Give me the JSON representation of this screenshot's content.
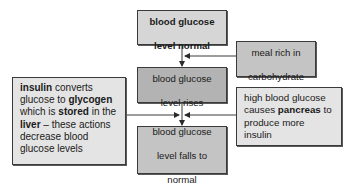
{
  "diagram": {
    "colors": {
      "box_light": "#d6d6d6",
      "box_medium": "#b3b3b3",
      "box_pale": "#e4e4e4",
      "border": "#3a3a3a",
      "line": "#3a3a3a"
    },
    "nodes": {
      "normal": {
        "line1": "blood glucose",
        "line2": "level normal",
        "bold": true
      },
      "meal": {
        "line1": "meal rich in",
        "line2": "carbohydrate"
      },
      "rises": {
        "line1": "blood glucose",
        "line2": "level rises"
      },
      "falls": {
        "line1": "blood glucose",
        "line2": "level falls to",
        "line3": "normal"
      },
      "insulin": {
        "seg1_bold": "insulin",
        "seg2": " converts glucose to ",
        "seg3_bold": "glycogen",
        "seg4": " which is ",
        "seg5_bold": "stored",
        "seg6": " in the ",
        "seg7_bold": "liver",
        "seg8": " – these actions decrease blood glucose levels"
      },
      "pancreas": {
        "seg1": "high blood glucose causes ",
        "seg2_bold": "pancreas",
        "seg3": " to produce more insulin"
      }
    },
    "edges": [
      {
        "from": "normal",
        "to": "rises"
      },
      {
        "from": "meal",
        "to": "normal-rises-line"
      },
      {
        "from": "rises",
        "to": "falls"
      },
      {
        "from": "insulin",
        "to": "rises-falls-line"
      },
      {
        "from": "pancreas",
        "to": "rises-falls-line"
      }
    ]
  }
}
